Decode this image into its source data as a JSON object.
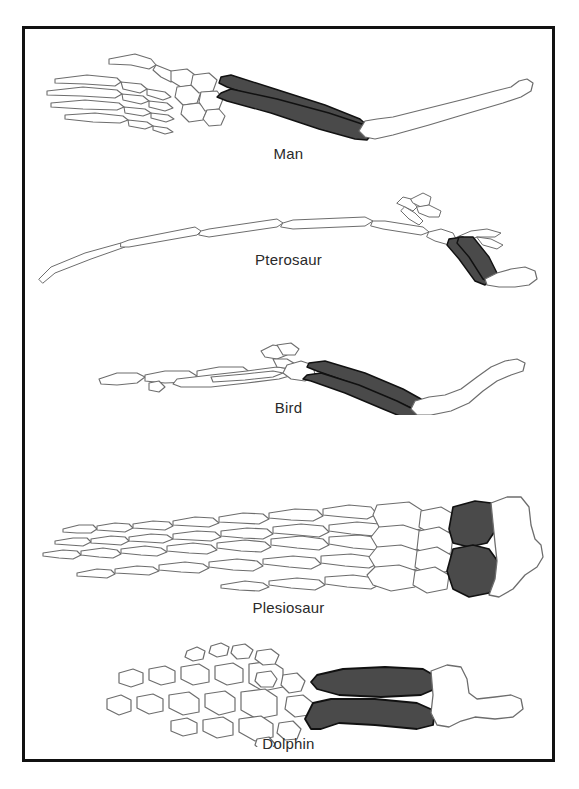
{
  "figure": {
    "kind": "comparative-anatomy-diagram",
    "background_color": "#ffffff",
    "border_color": "#111111"
  },
  "palette": {
    "bone_outline": "#6d6d6d",
    "bone_fill": "#ffffff",
    "shaded_bone_fill": "#4a4a4a",
    "shaded_bone_outline": "#111111",
    "caption_color": "#2a2a2a",
    "frame_border": "#111111"
  },
  "legend_note": {
    "shaded_meaning": "radius and ulna (forearm bones) shaded dark",
    "white_meaning": "humerus and hand bones left unshaded"
  },
  "specimens": [
    {
      "id": "man",
      "label": "Man",
      "order": 1,
      "limb_parts": [
        "phalanges",
        "metacarpals",
        "carpals",
        "radius",
        "ulna",
        "humerus"
      ],
      "shaded_parts": [
        "radius",
        "ulna"
      ],
      "description": "long slender arm with spread five-fingered hand at left and straight humerus at right"
    },
    {
      "id": "pterosaur",
      "label": "Pterosaur",
      "order": 2,
      "limb_parts": [
        "elongated wing finger",
        "free digits",
        "metacarpals",
        "carpals",
        "radius",
        "ulna",
        "humerus"
      ],
      "shaded_parts": [
        "radius",
        "ulna"
      ],
      "description": "enormously elongated wing finger sweeping to the left, short dark forearm and small humerus at lower right"
    },
    {
      "id": "bird",
      "label": "Bird",
      "order": 3,
      "limb_parts": [
        "digits",
        "carpometacarpus",
        "carpals",
        "radius",
        "ulna",
        "humerus"
      ],
      "shaded_parts": [
        "radius",
        "ulna"
      ],
      "description": "fused hand bones at left, bowed dark radius and ulna, S-curved humerus at right"
    },
    {
      "id": "plesiosaur",
      "label": "Plesiosaur",
      "order": 4,
      "limb_parts": [
        "hyperphalangeal digits",
        "metacarpals",
        "carpals",
        "radius",
        "ulna",
        "humerus"
      ],
      "shaded_parts": [
        "radius",
        "ulna"
      ],
      "description": "paddle with five long rows of many small phalanges, two stout dark forearm bones, broad humerus"
    },
    {
      "id": "dolphin",
      "label": "Dolphin",
      "order": 5,
      "limb_parts": [
        "phalanges",
        "metacarpals",
        "carpals",
        "radius",
        "ulna",
        "humerus"
      ],
      "shaded_parts": [
        "radius",
        "ulna"
      ],
      "description": "scattered blocky finger bones, two thick dark forearm bars, short stubby humerus"
    }
  ]
}
